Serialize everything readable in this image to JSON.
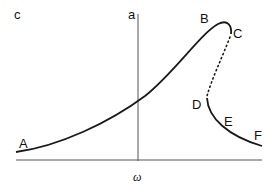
{
  "diagram": {
    "type": "hysteresis-curve",
    "colors": {
      "stroke": "#1a1a1a",
      "axis": "#555555",
      "background": "#ffffff"
    },
    "axes": {
      "vertical_label": "c",
      "x_label": "ω",
      "marker_label": "a"
    },
    "points": [
      {
        "id": "A",
        "label": "A"
      },
      {
        "id": "B",
        "label": "B"
      },
      {
        "id": "C",
        "label": "C"
      },
      {
        "id": "D",
        "label": "D"
      },
      {
        "id": "E",
        "label": "E"
      },
      {
        "id": "F",
        "label": "F"
      }
    ],
    "segments": [
      {
        "from": "A",
        "to": "C",
        "style": "solid"
      },
      {
        "from": "C",
        "to": "D",
        "style": "dotted"
      },
      {
        "from": "D",
        "to": "F",
        "style": "solid"
      }
    ]
  }
}
